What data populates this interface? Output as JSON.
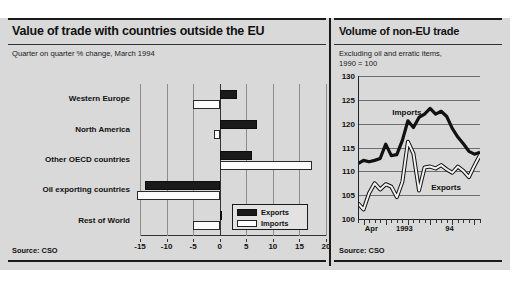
{
  "left_panel": {
    "title": "Value of trade with countries outside the EU",
    "subtitle": "Quarter on quarter % change, March 1994",
    "source": "Source: CSO",
    "legend": [
      {
        "label": "Exports",
        "swatch": "black"
      },
      {
        "label": "Imports",
        "swatch": "white"
      }
    ]
  },
  "right_panel": {
    "title": "Volume of non-EU trade",
    "subtitle_line1": "Excluding oil and erratic items,",
    "subtitle_line2": "1990 = 100",
    "source": "Source: CSO"
  },
  "chart_data": [
    {
      "type": "bar",
      "orientation": "horizontal",
      "title": "Value of trade with countries outside the EU",
      "subtitle": "Quarter on quarter % change, March 1994",
      "xlabel": "",
      "ylabel": "",
      "xlim": [
        -15,
        20
      ],
      "xticks": [
        -15,
        -10,
        -5,
        0,
        5,
        10,
        15,
        20
      ],
      "grid": "vertical",
      "legend_position": "bottom-right",
      "categories": [
        "Western Europe",
        "North America",
        "Other OECD countries",
        "Oil exporting countries",
        "Rest of World"
      ],
      "series": [
        {
          "name": "Exports",
          "color": "#1a1a1a",
          "values": [
            3.2,
            7.0,
            6.0,
            -14.0,
            0.4
          ]
        },
        {
          "name": "Imports",
          "color": "#ffffff",
          "values": [
            -5.0,
            -1.0,
            17.3,
            -15.5,
            -5.0
          ]
        }
      ]
    },
    {
      "type": "line",
      "title": "Volume of non-EU trade",
      "subtitle": "Excluding oil and erratic items, 1990 = 100",
      "xlabel": "",
      "ylabel": "",
      "ylim": [
        100,
        130
      ],
      "yticks": [
        100,
        105,
        110,
        115,
        120,
        125,
        130
      ],
      "grid": "horizontal",
      "xtick_labels": [
        "Apr",
        "1993",
        "94"
      ],
      "xtick_label_positions": [
        0.11,
        0.38,
        0.75
      ],
      "n_points": 23,
      "series": [
        {
          "name": "Imports",
          "color": "#111111",
          "style": "thick-solid",
          "label_position": {
            "x": 0.28,
            "y": 122.2
          },
          "values": [
            111.6,
            112.3,
            112.0,
            112.3,
            112.7,
            115.7,
            113.3,
            113.5,
            116.5,
            120.6,
            119.2,
            121.3,
            122.0,
            123.2,
            122.0,
            122.6,
            121.5,
            119.0,
            117.2,
            115.8,
            114.2,
            113.6,
            114.0
          ]
        },
        {
          "name": "Exports",
          "color": "#ffffff",
          "style": "outline",
          "label_position": {
            "x": 0.6,
            "y": 106.6
          },
          "values": [
            103.3,
            102.0,
            105.4,
            107.5,
            106.2,
            107.3,
            106.8,
            104.6,
            107.8,
            116.2,
            113.7,
            106.0,
            110.8,
            111.0,
            110.6,
            111.3,
            110.4,
            109.7,
            111.0,
            110.1,
            108.8,
            111.2,
            113.4
          ]
        }
      ]
    }
  ]
}
